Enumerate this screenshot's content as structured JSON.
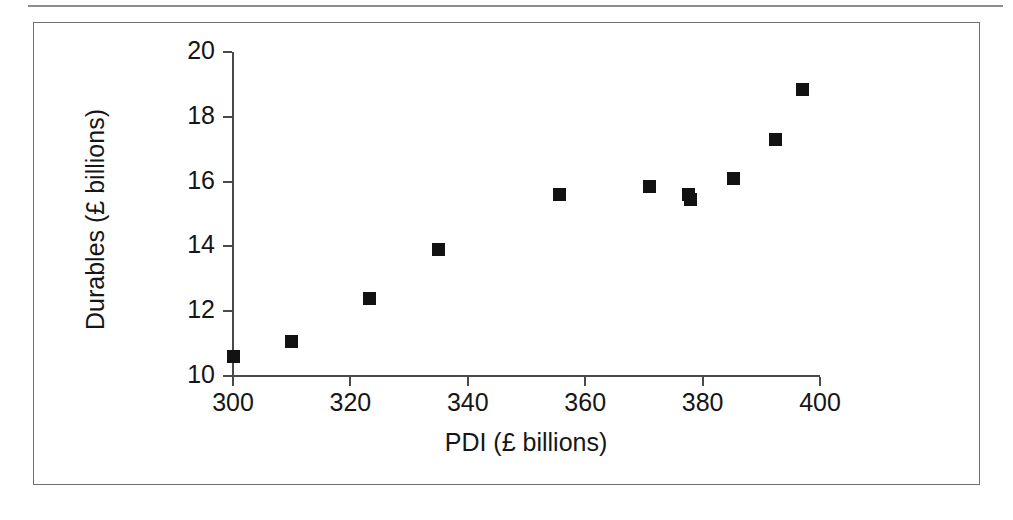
{
  "figure": {
    "background_color": "#ffffff",
    "frame_color": "#6f6f6f",
    "axis_color": "#4a4a4a",
    "marker_color": "#121212"
  },
  "chart_data": {
    "type": "scatter",
    "title": "",
    "xlabel": "PDI (£ billions)",
    "ylabel": "Durables (£ billions)",
    "xlim": [
      300,
      400
    ],
    "ylim": [
      10,
      20
    ],
    "xticks": [
      300,
      320,
      340,
      360,
      380,
      400
    ],
    "yticks": [
      10,
      12,
      14,
      16,
      18,
      20
    ],
    "xticklabels": [
      "300",
      "320",
      "340",
      "360",
      "380",
      "400"
    ],
    "yticklabels": [
      "10",
      "12",
      "14",
      "16",
      "18",
      "20"
    ],
    "grid": false,
    "legend": null,
    "marker": "square",
    "series": [
      {
        "name": "Durables vs PDI",
        "points": [
          {
            "x": 300.0,
            "y": 10.6
          },
          {
            "x": 310.0,
            "y": 11.05
          },
          {
            "x": 323.3,
            "y": 12.4
          },
          {
            "x": 335.0,
            "y": 13.9
          },
          {
            "x": 355.6,
            "y": 15.6
          },
          {
            "x": 371.0,
            "y": 15.85
          },
          {
            "x": 377.6,
            "y": 15.6
          },
          {
            "x": 378.0,
            "y": 15.45
          },
          {
            "x": 385.3,
            "y": 16.1
          },
          {
            "x": 392.4,
            "y": 17.3
          },
          {
            "x": 397.0,
            "y": 18.85
          }
        ]
      }
    ]
  }
}
